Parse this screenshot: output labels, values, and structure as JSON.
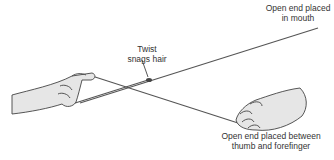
{
  "figure": {
    "labels": {
      "mouth_end": [
        "Open end placed",
        "in mouth"
      ],
      "twist": [
        "Twist",
        "snags hair"
      ],
      "thumb_end": [
        "Open end placed between",
        "thumb and forefinger"
      ]
    },
    "colors": {
      "string": "#555555",
      "hand_fill": "#e6e6e6",
      "hand_outline": "#444444",
      "text": "#333333"
    }
  }
}
